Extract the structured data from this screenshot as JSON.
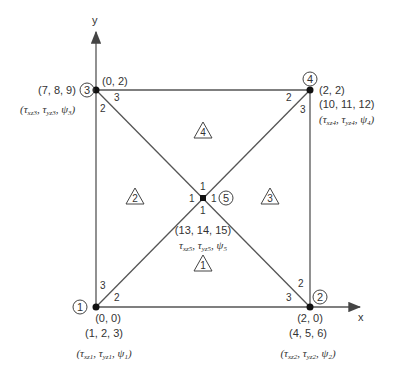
{
  "axes": {
    "x_label": "x",
    "y_label": "y"
  },
  "nodes": [
    {
      "id": "1",
      "coord": "(0, 0)",
      "dofs": "(1, 2, 3)",
      "vars": [
        "τ",
        "xz1",
        "τ",
        "yz1",
        "ψ",
        "1"
      ]
    },
    {
      "id": "2",
      "coord": "(2, 0)",
      "dofs": "(4, 5, 6)",
      "vars": [
        "τ",
        "xz2",
        "τ",
        "yz2",
        "ψ",
        "2"
      ]
    },
    {
      "id": "3",
      "coord": "(0, 2)",
      "dofs": "(7, 8, 9)",
      "vars": [
        "τ",
        "xz3",
        "τ",
        "yz3",
        "ψ",
        "3"
      ]
    },
    {
      "id": "4",
      "coord": "(2, 2)",
      "dofs": "(10, 11, 12)",
      "vars": [
        "τ",
        "xz4",
        "τ",
        "yz4",
        "ψ",
        "4"
      ]
    },
    {
      "id": "5",
      "coord": "",
      "dofs": "(13, 14, 15)",
      "vars": [
        "τ",
        "xz5",
        "τ",
        "yz5",
        "ψ",
        "5"
      ]
    }
  ],
  "elements": [
    "1",
    "2",
    "3",
    "4"
  ],
  "local_labels": {
    "n1_top": "3",
    "n1_diag": "2",
    "n2_top": "2",
    "n2_left": "3",
    "n3_diag": "3",
    "n3_down": "2",
    "n4_left": "2",
    "n4_down": "3",
    "c_top": "1",
    "c_left": "1",
    "c_right": "1",
    "c_bottom": "1"
  },
  "punct": {
    "open": "(",
    "close": ")",
    "comma": ", "
  }
}
